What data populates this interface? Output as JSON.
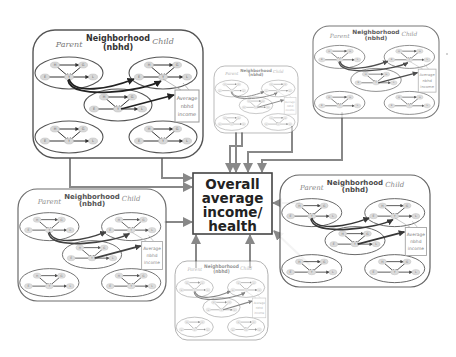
{
  "diagram": {
    "center": {
      "lines": [
        "Overall",
        "average",
        "income/",
        "health"
      ]
    },
    "neighborhood": {
      "title_lines": [
        "Neighborhood",
        "(nbhd)"
      ],
      "parent_label": "Parent",
      "child_label": "Child",
      "average_box_lines": [
        "Average",
        "nbhd",
        "income"
      ]
    },
    "family_nodes": {
      "top_left": "H",
      "top_right": "G",
      "left": "E",
      "center": "Y",
      "right": "L"
    },
    "neighborhoods": [
      {
        "id": "nbhd-top-left",
        "families": 5
      },
      {
        "id": "nbhd-top-center",
        "families": 5
      },
      {
        "id": "nbhd-top-right",
        "families": 5
      },
      {
        "id": "nbhd-bottom-left",
        "families": 5
      },
      {
        "id": "nbhd-bottom-right",
        "families": 5
      },
      {
        "id": "nbhd-bottom-center",
        "families": 5
      }
    ],
    "colors": {
      "box_stroke": "#555555",
      "connector": "#888888",
      "node_fill": "#d8d8d8",
      "strong_arrow": "#222222"
    }
  }
}
